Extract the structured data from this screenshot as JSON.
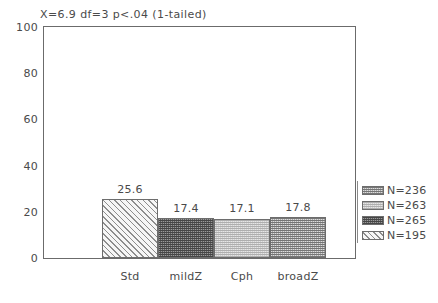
{
  "chart_data": {
    "type": "bar",
    "title": "X=6.9  df=3  p<.04 (1-tailed)",
    "xlabel": "",
    "ylabel": "",
    "categories": [
      "Std",
      "mildZ",
      "Cph",
      "broadZ"
    ],
    "values": [
      25.6,
      17.4,
      17.1,
      17.8
    ],
    "value_labels": [
      "25.6",
      "17.4",
      "17.1",
      "17.8"
    ],
    "ylim": [
      0,
      100
    ],
    "yticks": [
      0,
      20,
      40,
      60,
      80,
      100
    ],
    "ytick_labels": [
      "0",
      "20",
      "40",
      "60",
      "80",
      "100"
    ],
    "yminor_step": 5,
    "grid": false,
    "legend_position": "right",
    "legend": [
      {
        "label": "N=236",
        "pattern": "checker-medium"
      },
      {
        "label": "N=263",
        "pattern": "dot-light"
      },
      {
        "label": "N=265",
        "pattern": "checker-dark"
      },
      {
        "label": "N=195",
        "pattern": "diagonal-hatch"
      }
    ],
    "bar_patterns": [
      "diagonal-hatch",
      "checker-dark",
      "dot-light",
      "checker-medium"
    ]
  },
  "colors": {
    "axis": "#6b6b6b",
    "text": "#4a4a4a",
    "background": "#ffffff"
  }
}
